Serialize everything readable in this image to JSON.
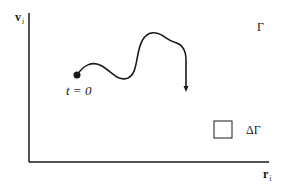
{
  "diagram": {
    "y_axis_label": "v",
    "y_axis_subscript": "i",
    "x_axis_label": "r",
    "x_axis_subscript": "i",
    "phase_space_label": "Γ",
    "volume_element_label": "ΔΓ",
    "start_label": "t = 0",
    "colors": {
      "stroke": "#1a1a1a",
      "background": "#ffffff"
    }
  }
}
